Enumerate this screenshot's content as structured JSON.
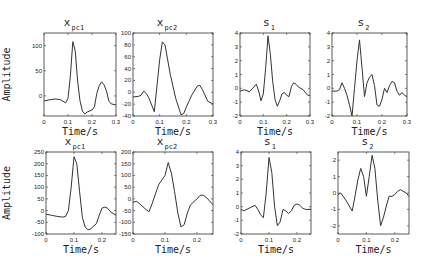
{
  "chart_data": [
    {
      "type": "line",
      "panel": "top-1",
      "title": "x",
      "title_sub": "pc1",
      "xlabel": "Time/s",
      "ylabel": "Amplitude",
      "xlim": [
        0,
        0.3
      ],
      "ylim": [
        -40,
        125
      ],
      "xticks": [
        0,
        0.1,
        0.2,
        0.3
      ],
      "yticks": [
        0,
        50,
        100
      ],
      "x": [
        0,
        0.02,
        0.05,
        0.07,
        0.09,
        0.1,
        0.11,
        0.12,
        0.13,
        0.14,
        0.15,
        0.16,
        0.17,
        0.18,
        0.2,
        0.21,
        0.22,
        0.23,
        0.24,
        0.25,
        0.26,
        0.27,
        0.28,
        0.3
      ],
      "y": [
        -10,
        -8,
        -6,
        -8,
        -14,
        -5,
        40,
        108,
        90,
        30,
        -10,
        -30,
        -36,
        -32,
        -28,
        -22,
        5,
        20,
        28,
        22,
        10,
        -10,
        -16,
        -18
      ]
    },
    {
      "type": "line",
      "panel": "top-2",
      "title": "x",
      "title_sub": "pc2",
      "xlabel": "Time/s",
      "ylabel": "",
      "xlim": [
        0,
        0.3
      ],
      "ylim": [
        -40,
        100
      ],
      "xticks": [
        0,
        0.1,
        0.2,
        0.3
      ],
      "yticks": [
        -40,
        -20,
        0,
        20,
        40,
        60,
        80,
        100
      ],
      "x": [
        0,
        0.02,
        0.03,
        0.04,
        0.05,
        0.06,
        0.08,
        0.1,
        0.11,
        0.12,
        0.14,
        0.16,
        0.18,
        0.19,
        0.2,
        0.22,
        0.24,
        0.25,
        0.26,
        0.28,
        0.3
      ],
      "y": [
        -8,
        -7,
        -5,
        2,
        -2,
        -10,
        -33,
        55,
        85,
        80,
        30,
        -10,
        -38,
        -36,
        -25,
        -5,
        10,
        12,
        5,
        -15,
        -20
      ]
    },
    {
      "type": "line",
      "panel": "top-3",
      "title": "s",
      "title_sub": "1",
      "xlabel": "Time/s",
      "ylabel": "",
      "xlim": [
        0,
        0.3
      ],
      "ylim": [
        -2,
        4
      ],
      "xticks": [
        0,
        0.1,
        0.2,
        0.3
      ],
      "yticks": [
        -2,
        -1,
        0,
        1,
        2,
        3,
        4
      ],
      "x": [
        0,
        0.02,
        0.04,
        0.06,
        0.07,
        0.08,
        0.09,
        0.1,
        0.11,
        0.12,
        0.13,
        0.14,
        0.15,
        0.16,
        0.17,
        0.18,
        0.19,
        0.2,
        0.21,
        0.22,
        0.23,
        0.24,
        0.25,
        0.27,
        0.29,
        0.3
      ],
      "y": [
        -0.2,
        -0.1,
        -0.25,
        0.1,
        0.3,
        -0.2,
        -0.9,
        -0.4,
        1.5,
        3.8,
        2.5,
        0.5,
        -0.8,
        -1.3,
        -0.9,
        -0.4,
        -0.3,
        -0.5,
        -0.6,
        0.1,
        0.4,
        0.3,
        0.1,
        -0.1,
        -0.5,
        -0.5
      ]
    },
    {
      "type": "line",
      "panel": "top-4",
      "title": "s",
      "title_sub": "2",
      "xlabel": "Time/s",
      "ylabel": "",
      "xlim": [
        0,
        0.3
      ],
      "ylim": [
        -2,
        4
      ],
      "xticks": [
        0,
        0.1,
        0.2,
        0.3
      ],
      "yticks": [
        -2,
        -1,
        0,
        1,
        2,
        3,
        4
      ],
      "x": [
        0,
        0.02,
        0.03,
        0.04,
        0.05,
        0.06,
        0.07,
        0.08,
        0.09,
        0.1,
        0.11,
        0.12,
        0.13,
        0.14,
        0.15,
        0.16,
        0.17,
        0.18,
        0.19,
        0.2,
        0.21,
        0.22,
        0.23,
        0.24,
        0.25,
        0.26,
        0.27,
        0.28,
        0.29,
        0.3
      ],
      "y": [
        -0.2,
        -0.2,
        -0.1,
        0.4,
        0.0,
        -0.5,
        -1.2,
        -2.0,
        0.0,
        2.0,
        3.5,
        1.5,
        -0.6,
        0.4,
        0.8,
        1.0,
        0.2,
        -1.2,
        -1.3,
        -0.8,
        0.0,
        -0.3,
        0.2,
        0.5,
        0.4,
        -0.2,
        -0.5,
        -0.3,
        -0.5,
        -0.6
      ]
    },
    {
      "type": "line",
      "panel": "bottom-1",
      "title": "x",
      "title_sub": "pc1",
      "xlabel": "Time/s",
      "ylabel": "Amplitude",
      "xlim": [
        0,
        0.25
      ],
      "ylim": [
        -100,
        250
      ],
      "xticks": [
        0,
        0.1,
        0.2
      ],
      "yticks": [
        -100,
        -50,
        0,
        50,
        100,
        150,
        200,
        250
      ],
      "x": [
        0,
        0.02,
        0.04,
        0.06,
        0.07,
        0.08,
        0.09,
        0.1,
        0.11,
        0.12,
        0.13,
        0.14,
        0.15,
        0.16,
        0.18,
        0.19,
        0.2,
        0.21,
        0.22,
        0.23,
        0.25
      ],
      "y": [
        -15,
        -20,
        -25,
        -28,
        -25,
        0,
        100,
        230,
        200,
        80,
        -30,
        -70,
        -82,
        -78,
        -55,
        -20,
        10,
        15,
        10,
        -5,
        -20
      ]
    },
    {
      "type": "line",
      "panel": "bottom-2",
      "title": "x",
      "title_sub": "pc2",
      "xlabel": "Time/s",
      "ylabel": "",
      "xlim": [
        0,
        0.25
      ],
      "ylim": [
        -150,
        200
      ],
      "xticks": [
        0,
        0.1,
        0.2
      ],
      "yticks": [
        -150,
        -100,
        -50,
        0,
        50,
        100,
        150,
        200
      ],
      "x": [
        0,
        0.01,
        0.02,
        0.04,
        0.05,
        0.06,
        0.08,
        0.09,
        0.1,
        0.11,
        0.12,
        0.13,
        0.14,
        0.15,
        0.16,
        0.17,
        0.18,
        0.2,
        0.21,
        0.22,
        0.23,
        0.25
      ],
      "y": [
        -15,
        -10,
        -20,
        -45,
        -55,
        -20,
        60,
        80,
        100,
        155,
        110,
        30,
        -60,
        -120,
        -110,
        -60,
        -25,
        0,
        15,
        15,
        5,
        -25
      ]
    },
    {
      "type": "line",
      "panel": "bottom-3",
      "title": "s",
      "title_sub": "1",
      "xlabel": "Time/s",
      "ylabel": "",
      "xlim": [
        0,
        0.25
      ],
      "ylim": [
        -2,
        4
      ],
      "xticks": [
        0,
        0.1,
        0.2
      ],
      "yticks": [
        -2,
        -1,
        0,
        1,
        2,
        3,
        4
      ],
      "x": [
        0,
        0.01,
        0.03,
        0.05,
        0.06,
        0.07,
        0.08,
        0.09,
        0.1,
        0.11,
        0.12,
        0.13,
        0.14,
        0.15,
        0.16,
        0.17,
        0.18,
        0.19,
        0.2,
        0.21,
        0.22,
        0.23,
        0.25
      ],
      "y": [
        -0.2,
        -0.3,
        -0.1,
        0.1,
        -0.2,
        -0.6,
        -0.8,
        1.0,
        3.6,
        2.5,
        0.0,
        -1.4,
        -1.1,
        -0.2,
        -0.3,
        -0.5,
        -0.3,
        0.1,
        0.2,
        0.1,
        -0.1,
        -0.2,
        -0.2
      ]
    },
    {
      "type": "line",
      "panel": "bottom-4",
      "title": "s",
      "title_sub": "2",
      "xlabel": "Time/s",
      "ylabel": "",
      "xlim": [
        0,
        0.25
      ],
      "ylim": [
        -2.5,
        2.5
      ],
      "xticks": [
        0,
        0.1,
        0.2
      ],
      "yticks": [
        -2,
        -1,
        0,
        1,
        2
      ],
      "x": [
        0,
        0.01,
        0.03,
        0.05,
        0.06,
        0.07,
        0.08,
        0.09,
        0.1,
        0.11,
        0.12,
        0.13,
        0.14,
        0.15,
        0.16,
        0.17,
        0.18,
        0.19,
        0.2,
        0.21,
        0.22,
        0.24,
        0.25
      ],
      "y": [
        -0.1,
        0.0,
        -0.5,
        -1.1,
        -0.2,
        0.8,
        1.5,
        1.0,
        -0.2,
        1.0,
        2.3,
        1.5,
        -0.5,
        -2.0,
        -1.5,
        -0.8,
        -0.2,
        -0.2,
        -0.1,
        0.1,
        0.2,
        0.0,
        -0.2
      ]
    }
  ]
}
